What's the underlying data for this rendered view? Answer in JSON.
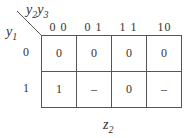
{
  "kmap": {
    "row_var": {
      "name": "y",
      "sub": "1"
    },
    "col_var": [
      {
        "name": "y",
        "sub": "2"
      },
      {
        "name": "y",
        "sub": "3"
      }
    ],
    "col_headers": [
      "0 0",
      "0 1",
      "1 1",
      "10"
    ],
    "row_headers": [
      "0",
      "1"
    ],
    "cells": [
      [
        "0",
        "0",
        "0",
        "0"
      ],
      [
        "1",
        "–",
        "0",
        "–"
      ]
    ],
    "output": {
      "name": "z",
      "sub": "2"
    }
  }
}
